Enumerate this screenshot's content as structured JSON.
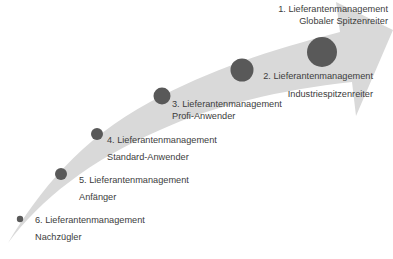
{
  "diagram": {
    "type": "maturity-arrow",
    "colors": {
      "arrow": "#d9d9d9",
      "dot": "#595959",
      "text": "#3c3c3c",
      "background": "#ffffff"
    },
    "levels": [
      {
        "rank": 6,
        "title": "6. Lieferantenmanagement",
        "subtitle": "Nachzügler"
      },
      {
        "rank": 5,
        "title": "5. Lieferantenmanagement",
        "subtitle": "Anfänger"
      },
      {
        "rank": 4,
        "title": "4. Lieferantenmanagement",
        "subtitle": "Standard-Anwender"
      },
      {
        "rank": 3,
        "title": "3. Lieferantenmanagement",
        "subtitle": "Profi-Anwender"
      },
      {
        "rank": 2,
        "title": "2. Lieferantenmanagement",
        "subtitle": "Industriespitzenreiter"
      },
      {
        "rank": 1,
        "title": "1. Lieferantenmanagement",
        "subtitle": "Globaler Spitzenreiter"
      }
    ]
  }
}
